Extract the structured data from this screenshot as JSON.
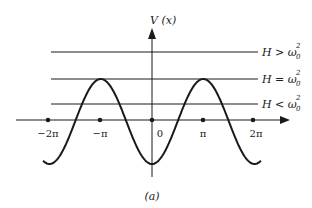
{
  "figure": {
    "caption": "(a)",
    "y_axis_label": "V (x)",
    "x_ticks": [
      {
        "label": "−2π",
        "x": 48
      },
      {
        "label": "−π",
        "x": 100
      },
      {
        "label": "0",
        "x": 152
      },
      {
        "label": "π",
        "x": 203
      },
      {
        "label": "2π",
        "x": 253
      }
    ],
    "energy_levels": [
      {
        "label": "H > ω",
        "sup": "2",
        "sub": "0",
        "y": 52
      },
      {
        "label": "H = ω",
        "sup": "2",
        "sub": "0",
        "y": 79
      },
      {
        "label": "H < ω",
        "sup": "2",
        "sub": "0",
        "y": 104
      }
    ],
    "curve": {
      "function": "V(x) = -cos(x)",
      "period": "2π",
      "min_at": "0",
      "max_at": "±π"
    },
    "colors": {
      "ink": "#1a1a1a",
      "background": "#ffffff"
    }
  }
}
